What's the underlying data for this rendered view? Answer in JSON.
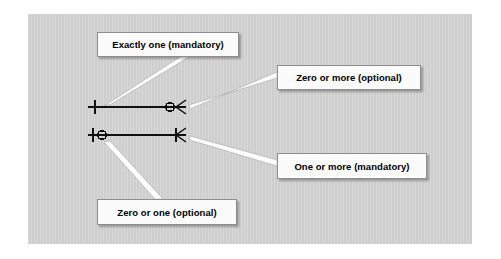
{
  "diagram": {
    "panel_color": "#d2d2d2",
    "line_color": "#101010",
    "callout_fill": "#fbfbfb",
    "callout_border": "#8e8e8e",
    "pointer_fill": "#ffffff",
    "labels": {
      "exactly_one": "Exactly one (mandatory)",
      "zero_or_more": "Zero or more (optional)",
      "one_or_more": "One or more (mandatory)",
      "zero_or_one": "Zero or one (optional)"
    },
    "rows": [
      {
        "name": "row-1",
        "y": 107,
        "x_start": 88,
        "x_end": 186,
        "left_symbol": "one-bar",
        "right_symbol": "circle-crowsfoot",
        "left_label": "Exactly one (mandatory)",
        "right_label": "Zero or more (optional)"
      },
      {
        "name": "row-2",
        "y": 135,
        "x_start": 88,
        "x_end": 186,
        "left_symbol": "bar-circle",
        "right_symbol": "bar-crowsfoot",
        "left_label": "Zero or one (optional)",
        "right_label": "One or more (mandatory)"
      }
    ]
  }
}
